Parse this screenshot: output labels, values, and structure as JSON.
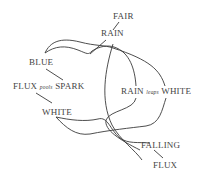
{
  "diagram": {
    "nodes": {
      "fair": {
        "label": "FAIR"
      },
      "rain": {
        "label": "RAIN"
      },
      "blue": {
        "label": "BLUE"
      },
      "flux_spark": {
        "left": "FLUX",
        "mid": "pools",
        "right": "SPARK"
      },
      "rain_white": {
        "left": "RAIN",
        "mid": "leaps",
        "right": "WHITE"
      },
      "white": {
        "label": "WHITE"
      },
      "falling": {
        "label": "FALLING"
      },
      "flux": {
        "label": "FLUX"
      }
    },
    "colors": {
      "ink": "#3a3a3a",
      "text": "#444444",
      "background": "#ffffff"
    }
  }
}
